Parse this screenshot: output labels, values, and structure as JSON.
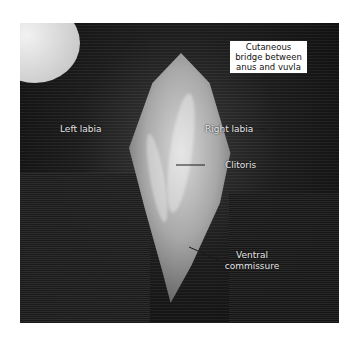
{
  "figure": {
    "annotations": {
      "callout": "Cutaneous bridge between anus and vuvla",
      "left_labia": "Left labia",
      "right_labia": "Right labia",
      "clitoris": "Clitoris",
      "ventral_commissure_line1": "Ventral",
      "ventral_commissure_line2": "commissure"
    },
    "colors": {
      "background": "#ffffff",
      "callout_bg": "#ffffff",
      "label_text": "#e6e6e6",
      "leader_line": "#1a1a1a"
    }
  }
}
